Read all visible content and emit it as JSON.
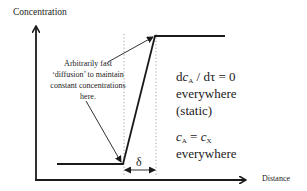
{
  "axes": {
    "y_label": "Concentration",
    "x_label": "Distance"
  },
  "annotation": {
    "lines": [
      "Arbitrarily fast",
      "‘diffusion’ to maintain",
      "constant concentrations",
      "here."
    ]
  },
  "gap_label": "δ",
  "right_text": {
    "eq1": {
      "d1": "d",
      "c": "c",
      "sub_a": "A",
      "slash": " / dτ = 0"
    },
    "eq1_line2": "everywhere",
    "eq1_line3": "(static)",
    "eq2": {
      "c1": "c",
      "sub_a": "A",
      "eq": " = ",
      "c2": "c",
      "sub_x": "X"
    },
    "eq2_line2": "everywhere"
  },
  "colors": {
    "line": "#1a1a1a",
    "dotted": "#8a8a8a",
    "background": "#ffffff"
  }
}
